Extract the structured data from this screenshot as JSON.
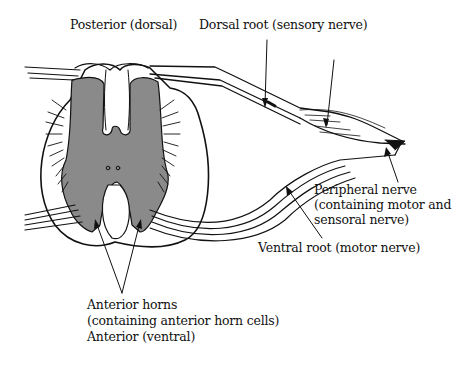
{
  "diagram": {
    "colors": {
      "grey_matter": "#8a8a8a",
      "outline": "#111111",
      "background": "#ffffff"
    },
    "labels": {
      "posterior": "Posterior (dorsal)",
      "dorsal_root": "Dorsal root (sensory nerve)",
      "peripheral_nerve_line1": "Peripheral nerve",
      "peripheral_nerve_line2": "(containing motor and",
      "peripheral_nerve_line3": "sensoral nerve)",
      "ventral_root": "Ventral root (motor nerve)",
      "anterior_horns_line1": "Anterior horns",
      "anterior_horns_line2": "(containing anterior horn cells)",
      "anterior": "Anterior (ventral)"
    }
  }
}
